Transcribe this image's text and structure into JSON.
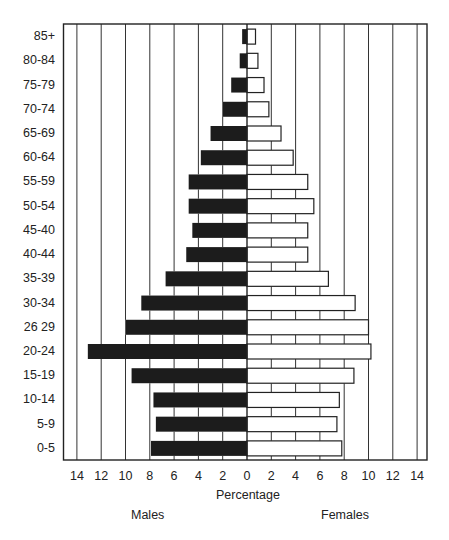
{
  "chart_data": {
    "type": "bar",
    "subtype": "population-pyramid",
    "title": "",
    "xlabel": "Percentage",
    "ylabel": "",
    "xlim": [
      -14,
      14
    ],
    "x_ticks": [
      14,
      12,
      10,
      8,
      6,
      4,
      2,
      0,
      2,
      4,
      6,
      8,
      10,
      12,
      14
    ],
    "grid": true,
    "legend": null,
    "side_labels": {
      "left": "Males",
      "right": "Females"
    },
    "categories": [
      "85+",
      "80-84",
      "75-79",
      "70-74",
      "65-69",
      "60-64",
      "55-59",
      "50-54",
      "45-40",
      "40-44",
      "35-39",
      "30-34",
      "26 29",
      "20-24",
      "15-19",
      "10-14",
      "5-9",
      "0-5"
    ],
    "series": [
      {
        "name": "Males",
        "color": "#1c1c1c",
        "values": [
          0.4,
          0.6,
          1.3,
          2.0,
          3.0,
          3.8,
          4.8,
          4.8,
          4.5,
          5.0,
          6.7,
          8.7,
          10.0,
          13.1,
          9.5,
          7.7,
          7.5,
          7.9
        ]
      },
      {
        "name": "Females",
        "color": "#ffffff",
        "values": [
          0.7,
          0.9,
          1.4,
          1.8,
          2.8,
          3.8,
          5.0,
          5.5,
          5.0,
          5.0,
          6.7,
          8.9,
          10.0,
          10.2,
          8.8,
          7.6,
          7.4,
          7.8
        ]
      }
    ]
  },
  "labels": {
    "xlabel": "Percentage",
    "males": "Males",
    "females": "Females"
  }
}
